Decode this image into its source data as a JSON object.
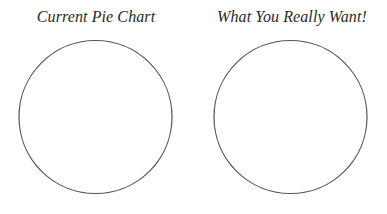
{
  "charts": [
    {
      "title": "Current Pie Chart",
      "cx": 95.5,
      "cy": 117,
      "r": 76.5
    },
    {
      "title": "What You Really Want!",
      "cx": 290.5,
      "cy": 117,
      "r": 76.5
    }
  ],
  "style": {
    "stroke": "#555555",
    "background": "#ffffff"
  },
  "chart_data": [
    {
      "type": "pie",
      "title": "Current Pie Chart",
      "values": [],
      "categories": []
    },
    {
      "type": "pie",
      "title": "What You Really Want!",
      "values": [],
      "categories": []
    }
  ]
}
